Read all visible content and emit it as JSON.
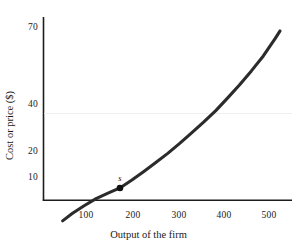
{
  "chart_data": {
    "type": "line",
    "title": "",
    "subtitle": "",
    "xlabel": "Output of the firm",
    "ylabel": "Cost or price ($)",
    "xlim": [
      40,
      560
    ],
    "ylim": [
      5,
      80
    ],
    "yscale": "log",
    "xscale": "linear",
    "grid": false,
    "legend": null,
    "xticks": [
      100,
      200,
      300,
      400,
      500
    ],
    "xtick_labels": [
      "100",
      "200",
      "300",
      "400",
      "500"
    ],
    "yticks": [
      10,
      20,
      40,
      70
    ],
    "ytick_labels": [
      "10",
      "20",
      "40",
      "70"
    ],
    "series": [
      {
        "name": "marginal cost curve",
        "color": "#2b2b2b",
        "x": [
          80,
          100,
          125,
          150,
          175,
          200,
          225,
          250,
          275,
          300,
          325,
          350,
          375,
          400,
          425,
          450,
          475,
          500,
          525,
          535
        ],
        "y": [
          6.0,
          6.6,
          7.3,
          8.0,
          8.6,
          9.2,
          10.2,
          11.4,
          12.8,
          14.4,
          16.4,
          18.8,
          21.6,
          25.0,
          29.5,
          35.0,
          42.0,
          51.0,
          64.0,
          70.5
        ]
      }
    ],
    "annotations": [
      {
        "label": "s",
        "x": 200,
        "y": 9.2,
        "marker": "filled-circle",
        "marker_color": "#111111",
        "label_position": "above"
      }
    ]
  },
  "axes": {
    "x_axis_title": "Output of the firm",
    "y_axis_title": "Cost or price ($)"
  }
}
